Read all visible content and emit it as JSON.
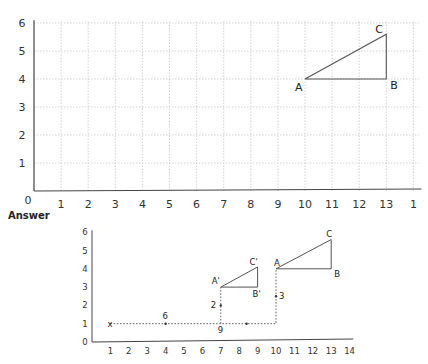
{
  "answer_label": "Answer",
  "chart_data": [
    {
      "type": "diagram",
      "title": "",
      "grid": true,
      "xlim": [
        0,
        14
      ],
      "ylim": [
        0,
        6
      ],
      "x_ticks": [
        "0",
        "1",
        "2",
        "3",
        "4",
        "5",
        "6",
        "7",
        "8",
        "9",
        "10",
        "11",
        "12",
        "13",
        "1"
      ],
      "y_ticks": [
        "1",
        "2",
        "3",
        "4",
        "5",
        "6"
      ],
      "triangle": {
        "A": [
          10,
          4
        ],
        "B": [
          13,
          4
        ],
        "C": [
          13,
          5.6
        ]
      },
      "labels": {
        "A": "A",
        "B": "B",
        "C": "C"
      }
    },
    {
      "type": "diagram",
      "title": "Answer",
      "grid": false,
      "xlim": [
        0,
        14
      ],
      "ylim": [
        0,
        6
      ],
      "x_ticks": [
        "1",
        "2",
        "3",
        "4",
        "5",
        "6",
        "7",
        "8",
        "9",
        "10",
        "11",
        "12",
        "13",
        "14"
      ],
      "y_ticks": [
        "0",
        "1",
        "2",
        "3",
        "4",
        "5",
        "6"
      ],
      "triangle_original": {
        "A": [
          10,
          4
        ],
        "B": [
          13,
          4
        ],
        "C": [
          13,
          5.6
        ]
      },
      "triangle_image": {
        "A'": [
          7,
          3
        ],
        "B'": [
          9,
          3
        ],
        "C'": [
          9,
          4.1
        ]
      },
      "labels": {
        "A": "A",
        "B": "B",
        "C": "C",
        "A_prime": "A'",
        "B_prime": "B'",
        "C_prime": "C'",
        "x_mark": "x"
      },
      "path_annotations": [
        {
          "text": "6",
          "at": [
            4,
            1
          ]
        },
        {
          "text": "9",
          "at": [
            7,
            1
          ]
        },
        {
          "text": "3",
          "at": [
            10,
            2.5
          ]
        },
        {
          "text": "2",
          "at": [
            7,
            2
          ]
        }
      ]
    }
  ]
}
